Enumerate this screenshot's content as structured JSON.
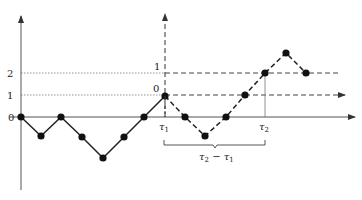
{
  "figure": {
    "type": "random-walk-diagram",
    "axis_y_labels": {
      "zero": "0",
      "one": "1",
      "two": "2"
    },
    "shifted_axis_labels": {
      "zero": "0",
      "one": "1"
    },
    "x_labels": {
      "tau1": "τ",
      "tau1_sub": "1",
      "tau2": "τ",
      "tau2_sub": "2"
    },
    "brace_label": {
      "a": "τ",
      "a_sub": "2",
      "minus": " − ",
      "b": "τ",
      "b_sub": "1"
    },
    "colors": {
      "line": "#222222",
      "axis": "#555555",
      "dotted": "#777777"
    }
  },
  "walk": {
    "solid_points": [
      [
        21,
        117
      ],
      [
        41,
        136
      ],
      [
        61,
        117
      ],
      [
        82,
        137
      ],
      [
        103,
        158
      ],
      [
        124,
        137
      ],
      [
        144,
        117
      ],
      [
        165,
        96
      ]
    ],
    "dashed_points": [
      [
        165,
        96
      ],
      [
        185,
        117
      ],
      [
        205,
        136
      ],
      [
        226,
        117
      ],
      [
        245,
        95
      ],
      [
        265,
        73
      ],
      [
        286,
        53
      ],
      [
        306,
        73
      ]
    ]
  }
}
